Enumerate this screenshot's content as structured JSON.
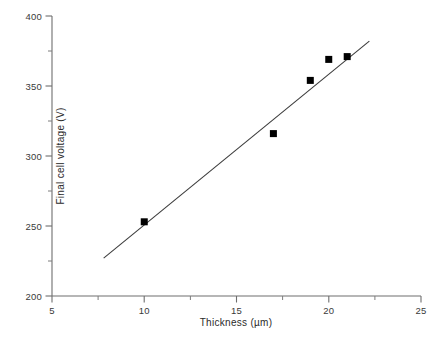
{
  "chart_data": {
    "type": "scatter",
    "title": "",
    "subtitle": "",
    "xlabel": "Thickness (µm)",
    "ylabel": "Final cell voltage (V)",
    "xlim": [
      5,
      25
    ],
    "ylim": [
      200,
      400
    ],
    "xticks": [
      5,
      10,
      15,
      20,
      25
    ],
    "xtick_labels": [
      "5",
      "10",
      "15",
      "20",
      "25"
    ],
    "xminor_ticks": [
      7.5,
      12.5,
      17.5,
      22.5
    ],
    "yticks": [
      200,
      250,
      300,
      350,
      400
    ],
    "ytick_labels": [
      "200",
      "250",
      "300",
      "350",
      "400"
    ],
    "yminor_ticks": [
      225,
      275,
      325,
      375
    ],
    "grid": false,
    "legend": null,
    "annotations": [],
    "series": [
      {
        "name": "Measured cells",
        "type": "scatter",
        "marker": "square",
        "marker_color": "#000000",
        "marker_size": 7,
        "x": [
          10,
          17,
          19,
          20,
          21
        ],
        "y": [
          253,
          316,
          354,
          369,
          371
        ]
      },
      {
        "name": "Linear fit",
        "type": "line",
        "line_color": "#3a3a3a",
        "line_width": 1,
        "x": [
          7.8,
          22.2
        ],
        "y": [
          227,
          382
        ]
      }
    ],
    "colors": {
      "marker": "#000000",
      "line": "#3a3a3a",
      "axis": "#6e6e6e",
      "text": "#2b2b2b",
      "background": "#ffffff"
    }
  }
}
